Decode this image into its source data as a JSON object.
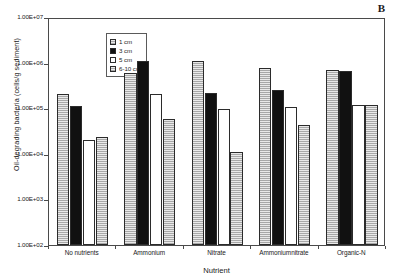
{
  "panel": {
    "label": "B"
  },
  "chart_data": {
    "type": "bar",
    "title": "",
    "subtitle": "",
    "panel_label": "B",
    "xlabel": "Nutrient",
    "ylabel": "Oil-degrading bacteria (cells/g sediment)",
    "yscale": "log",
    "ylim": [
      100,
      10000000
    ],
    "ytick_values": [
      10000000,
      1000000,
      100000,
      10000,
      1000,
      100
    ],
    "ytick_labels": [
      "1.00E+07",
      "1.00E+06",
      "1.00E+05",
      "1.00E+04",
      "1.00E+03",
      "1.00E+02"
    ],
    "grid": false,
    "legend_position": "top-left inside",
    "categories": [
      "No nutrients",
      "Ammonium",
      "Nitrate",
      "Ammoniumnitrate",
      "Organic-N"
    ],
    "series": [
      {
        "name": "1 cm",
        "color": "#a8a8a8",
        "fill": "hatched-horizontal-lines",
        "values": [
          200000,
          600000,
          1100000,
          750000,
          680000
        ]
      },
      {
        "name": "3 cm",
        "color": "#111111",
        "fill": "solid-black",
        "values": [
          110000,
          1100000,
          220000,
          250000,
          650000
        ]
      },
      {
        "name": "5 cm",
        "color": "#ffffff",
        "fill": "solid-white",
        "values": [
          20000,
          210000,
          98000,
          105000,
          120000
        ]
      },
      {
        "name": "6-10 cm",
        "color": "#a8a8a8",
        "fill": "hatched-horizontal-lines",
        "values": [
          23000,
          58000,
          11000,
          43000,
          120000
        ]
      }
    ]
  }
}
